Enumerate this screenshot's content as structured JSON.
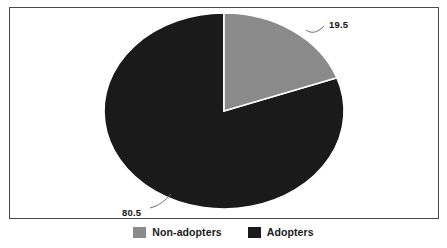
{
  "chart_data": {
    "type": "pie",
    "title": "",
    "categories": [
      "Non-adopters",
      "Adopters"
    ],
    "values": [
      80.5,
      19.5
    ],
    "labels": [
      "80.5",
      "19.5"
    ],
    "colors": [
      "#1a1a1a",
      "#8a8a8a"
    ],
    "legend_position": "bottom",
    "grid": false,
    "start_angle_deg": 90,
    "direction": "clockwise",
    "note": "Adopters slice (19.5) rendered in grey starting at 12 o'clock going clockwise; Non-adopters slice (80.5) rendered in near-black"
  },
  "legend": {
    "entries": [
      {
        "label": "Non-adopters",
        "color": "#8a8a8a"
      },
      {
        "label": "Adopters",
        "color": "#1a1a1a"
      }
    ]
  },
  "annotations": {
    "adopters_value": "19.5",
    "nonadopters_value": "80.5"
  },
  "theme": {
    "background": "#ffffff",
    "frame_border": "#4a4a4a",
    "text": "#141414",
    "leader_line": "#6e6e6e"
  }
}
